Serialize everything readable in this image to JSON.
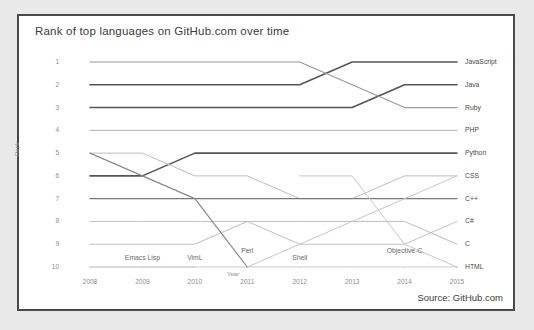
{
  "card": {
    "title": "Rank of top languages on GitHub.com over time",
    "source": "Source: GitHub.com"
  },
  "chart_data": {
    "type": "line",
    "title": "Rank of top languages on GitHub.com over time",
    "xlabel": "Year",
    "ylabel": "Rank",
    "x": [
      2008,
      2009,
      2010,
      2011,
      2012,
      2013,
      2014,
      2015
    ],
    "xticklabels": [
      "2008",
      "2009",
      "2010",
      "2011",
      "2012",
      "2013",
      "2014",
      "2015"
    ],
    "yticklabels": [
      "1",
      "2",
      "3",
      "4",
      "5",
      "6",
      "7",
      "8",
      "9",
      "10"
    ],
    "ylim": [
      1,
      10
    ],
    "y_inverted": true,
    "grid": false,
    "legend": "right-edge-labels",
    "series": [
      {
        "name": "JavaScript",
        "values": [
          2,
          2,
          2,
          2,
          2,
          1,
          1,
          1
        ],
        "color": "#555555",
        "width": 1.6
      },
      {
        "name": "Java",
        "values": [
          3,
          3,
          3,
          3,
          3,
          3,
          2,
          2
        ],
        "color": "#555555",
        "width": 1.6
      },
      {
        "name": "Ruby",
        "values": [
          1,
          1,
          1,
          1,
          1,
          2,
          3,
          3
        ],
        "color": "#9a9a9a",
        "width": 1.2
      },
      {
        "name": "PHP",
        "values": [
          4,
          4,
          4,
          4,
          4,
          4,
          4,
          4
        ],
        "color": "#b0b0b0",
        "width": 1.0
      },
      {
        "name": "Python",
        "values": [
          6,
          6,
          5,
          5,
          5,
          5,
          5,
          5
        ],
        "color": "#555555",
        "width": 1.6
      },
      {
        "name": "CSS",
        "values": [
          5,
          5,
          6,
          6,
          7,
          7,
          6,
          6
        ],
        "color": "#bdbdbd",
        "width": 1.0
      },
      {
        "name": "C++",
        "values": [
          7,
          7,
          7,
          7,
          7,
          7,
          7,
          7
        ],
        "color": "#7a7a7a",
        "width": 1.2
      },
      {
        "name": "C#",
        "values": [
          8,
          8,
          8,
          8,
          9,
          9,
          9,
          8
        ],
        "color": "#c2c2c2",
        "width": 1.0
      },
      {
        "name": "C",
        "values": [
          9,
          9,
          9,
          8,
          8,
          8,
          8,
          9
        ],
        "color": "#bdbdbd",
        "width": 1.0
      },
      {
        "name": "HTML",
        "values": [
          10,
          10,
          10,
          10,
          10,
          10,
          10,
          10
        ],
        "color": "#cccccc",
        "width": 1.0
      },
      {
        "name": "Perl",
        "values": [
          5,
          6,
          7,
          10,
          null,
          null,
          null,
          null
        ],
        "color": "#8a8a8a",
        "width": 1.2
      },
      {
        "name": "Emacs Lisp",
        "values": [
          10,
          10,
          null,
          null,
          null,
          null,
          null,
          null
        ],
        "color": "#d0d0d0",
        "width": 1.0
      },
      {
        "name": "VimL",
        "values": [
          null,
          10,
          10,
          null,
          null,
          null,
          null,
          null
        ],
        "color": "#d0d0d0",
        "width": 1.0
      },
      {
        "name": "Shell",
        "values": [
          null,
          null,
          null,
          10,
          9,
          8,
          7,
          6
        ],
        "color": "#c8c8c8",
        "width": 1.0
      },
      {
        "name": "Objective-C",
        "values": [
          null,
          null,
          null,
          null,
          6,
          6,
          9,
          10
        ],
        "color": "#c8c8c8",
        "width": 1.0
      }
    ],
    "right_labels": [
      "JavaScript",
      "Java",
      "Ruby",
      "PHP",
      "Python",
      "CSS",
      "C++",
      "C#",
      "C",
      "HTML"
    ],
    "inline_labels": [
      {
        "text": "Emacs Lisp",
        "x": 2009,
        "rank": 9.6
      },
      {
        "text": "VimL",
        "x": 2010,
        "rank": 9.6
      },
      {
        "text": "Perl",
        "x": 2011,
        "rank": 9.3
      },
      {
        "text": "Shell",
        "x": 2012,
        "rank": 9.6
      },
      {
        "text": "Objective-C",
        "x": 2014,
        "rank": 9.3
      }
    ]
  }
}
